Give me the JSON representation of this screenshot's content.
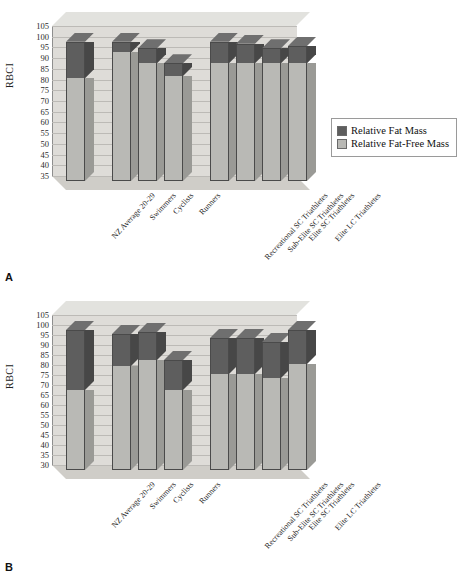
{
  "figure": {
    "panel_a_letter": "A",
    "panel_b_letter": "B"
  },
  "chart_data": [
    {
      "type": "bar",
      "panel": "A",
      "title": "",
      "xlabel": "",
      "ylabel": "RBCI",
      "ylim": [
        35,
        105
      ],
      "ytick_step": 5,
      "yticks": [
        105,
        100,
        95,
        90,
        85,
        80,
        75,
        70,
        65,
        60,
        55,
        50,
        45,
        40,
        35
      ],
      "grid": true,
      "stacked": true,
      "legend_position": "right",
      "categories": [
        "NZ Average 20-29",
        "Swimmers",
        "Cyclists",
        "Runners",
        "Recreational SC Triathletes",
        "Sub-Elite SC Triathletes",
        "Elite SC Triathletes",
        "Elite LC Triathletes"
      ],
      "series": [
        {
          "name": "Relative Fat-Free Mass",
          "color": "#b9b9b5",
          "values": [
            83,
            95,
            90,
            84,
            90,
            90,
            90,
            90
          ]
        },
        {
          "name": "Relative Fat Mass",
          "color": "#5e5e5e",
          "values": [
            17,
            5,
            7,
            6,
            10,
            9,
            7,
            8
          ]
        }
      ],
      "totals": [
        100,
        100,
        97,
        90,
        100,
        99,
        97,
        98
      ],
      "legend": [
        {
          "label": "Relative Fat Mass",
          "color": "#5e5e5e"
        },
        {
          "label": "Relative Fat-Free Mass",
          "color": "#b9b9b5"
        }
      ]
    },
    {
      "type": "bar",
      "panel": "B",
      "title": "",
      "xlabel": "",
      "ylabel": "RBCI",
      "ylim": [
        30,
        105
      ],
      "ytick_step": 5,
      "yticks": [
        105,
        100,
        95,
        90,
        85,
        80,
        75,
        70,
        65,
        60,
        55,
        50,
        45,
        40,
        35,
        30
      ],
      "grid": true,
      "stacked": true,
      "legend_position": "right",
      "categories": [
        "NZ Average 20-29",
        "Swimmers",
        "Cyclists",
        "Runners",
        "Recreational SC Triathletes",
        "Sub-Elite SC Triathletes",
        "Elite SC Triathletes",
        "Elite LC Triathletes"
      ],
      "series": [
        {
          "name": "Relative Fat-Free Mass",
          "color": "#b9b9b5",
          "values": [
            70,
            82,
            85,
            70,
            78,
            78,
            76,
            83
          ]
        },
        {
          "name": "Relative Fat-Free Mass",
          "color": "#5e5e5e",
          "values": [
            30,
            16,
            14,
            15,
            18,
            18,
            18,
            17
          ]
        }
      ],
      "totals": [
        100,
        98,
        99,
        85,
        96,
        96,
        94,
        100
      ],
      "legend": [
        {
          "label": "Relative Fat-Free Mass",
          "color": "#5e5e5e"
        },
        {
          "label": "Relative Fat-Free Mass",
          "color": "#b9b9b5"
        }
      ]
    }
  ]
}
